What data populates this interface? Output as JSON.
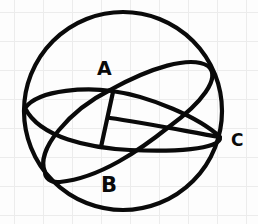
{
  "diagram": {
    "type": "sphere-with-great-circles",
    "style": "hand-drawn on grid paper",
    "stroke_color": "#0a0a0a",
    "grid_color": "#ececec",
    "labels": {
      "a": "A",
      "b": "B",
      "c": "C"
    },
    "elements": [
      {
        "name": "sphere-outline",
        "shape": "circle"
      },
      {
        "name": "equator-ellipse",
        "shape": "ellipse",
        "passes_through": [
          "A",
          "C"
        ]
      },
      {
        "name": "tilted-great-circle",
        "shape": "ellipse",
        "passes_through": [
          "A",
          "B"
        ]
      },
      {
        "name": "segment-from-a",
        "shape": "line"
      },
      {
        "name": "segment-to-c",
        "shape": "line"
      }
    ]
  }
}
